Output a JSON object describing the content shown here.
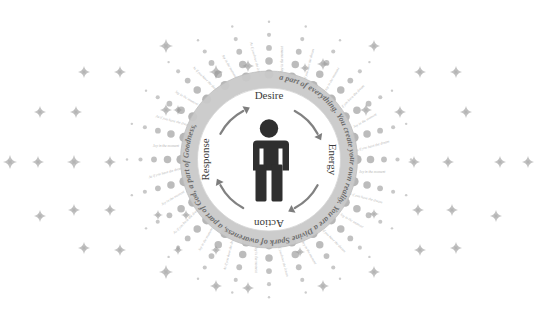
{
  "canvas": {
    "width": 538,
    "height": 319,
    "background": "#ffffff"
  },
  "diagram": {
    "center_figure": {
      "name": "human-figure",
      "color": "#2f2f2f"
    },
    "ring": {
      "band_color": "#c9c9c9",
      "text_color": "#6d6d6d",
      "phrases": [
        "a part of everything.",
        "You create your own reality.",
        "You are a Divine Spark of awareness,",
        "a part of God,",
        "a part of Goodness,"
      ],
      "full_text": "a part of everything. You create your own reality. You are a Divine Spark of awareness, a part of God, a part of Goodness,"
    },
    "cycle": {
      "direction": "clockwise",
      "arrow_color": "#6f6f6f",
      "steps": [
        {
          "label": "Desire",
          "position": "top"
        },
        {
          "label": "Energy",
          "position": "right"
        },
        {
          "label": "Action",
          "position": "bottom"
        },
        {
          "label": "Response",
          "position": "left"
        }
      ]
    },
    "rays": {
      "dot_color": "#9a9a9a",
      "label_color": "#b6b6b6",
      "labels": [
        "Joy in the moment",
        "As if you have the dream",
        "Joy in the moment",
        "As if you have the dream",
        "Joy in the moment",
        "As if you have the dream",
        "Joy in the moment",
        "As if you have the dream",
        "Joy in the moment",
        "As if you have the dream",
        "Joy in the moment",
        "As if you have the dream",
        "Joy in the moment",
        "As if you have the dream",
        "Joy in the moment",
        "As if you have the dream",
        "Joy in the moment",
        "As if you have the dream",
        "Joy in the moment",
        "As if you have the dream",
        "Joy in the moment",
        "As if you have the dream",
        "Joy in the moment",
        "As if you have the dream"
      ]
    },
    "sparkles": {
      "color": "#9b9b9b",
      "count": 46
    }
  }
}
